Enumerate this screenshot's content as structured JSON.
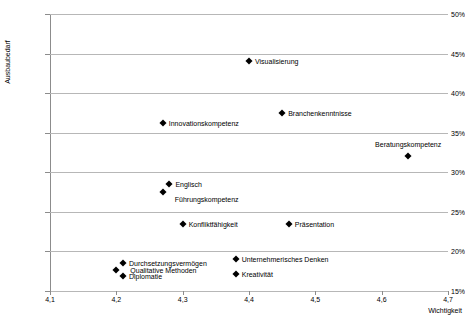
{
  "chart_data": {
    "type": "scatter",
    "title": "",
    "xlabel": "Wichtigkeit",
    "ylabel": "Ausbaubedarf",
    "xlim": [
      4.1,
      4.7
    ],
    "ylim": [
      15,
      50
    ],
    "grid": true,
    "legend": "none",
    "x_tick_labels": [
      "4,1",
      "4,2",
      "4,3",
      "4,4",
      "4,5",
      "4,6",
      "4,7"
    ],
    "x_tick_values": [
      4.1,
      4.2,
      4.3,
      4.4,
      4.5,
      4.6,
      4.7
    ],
    "y_tick_labels": [
      "50%",
      "45%",
      "40%",
      "35%",
      "30%",
      "25%",
      "20%",
      "15%"
    ],
    "y_tick_values": [
      50,
      45,
      40,
      35,
      30,
      25,
      20,
      15
    ],
    "marker": "diamond",
    "marker_color": "#000000",
    "points": [
      {
        "label": "Visualisierung",
        "x": 4.4,
        "y": 44.0,
        "label_pos": "right"
      },
      {
        "label": "Branchenkenntnisse",
        "x": 4.45,
        "y": 37.5,
        "label_pos": "right"
      },
      {
        "label": "Innovationskompetenz",
        "x": 4.27,
        "y": 36.2,
        "label_pos": "right"
      },
      {
        "label": "Beratungskompetenz",
        "x": 4.64,
        "y": 32.0,
        "label_pos": "above"
      },
      {
        "label": "Englisch",
        "x": 4.28,
        "y": 28.5,
        "label_pos": "right"
      },
      {
        "label": "Führungskompetenz",
        "x": 4.27,
        "y": 27.5,
        "label_pos": "right-low"
      },
      {
        "label": "Konfliktfähigkeit",
        "x": 4.3,
        "y": 23.5,
        "label_pos": "right"
      },
      {
        "label": "Präsentation",
        "x": 4.46,
        "y": 23.5,
        "label_pos": "right"
      },
      {
        "label": "Durchsetzungsvermögen",
        "x": 4.21,
        "y": 18.5,
        "label_pos": "right"
      },
      {
        "label": "Qualitative Methoden",
        "x": 4.2,
        "y": 17.7,
        "label_pos": "right-far"
      },
      {
        "label": "Diplomatie",
        "x": 4.21,
        "y": 16.9,
        "label_pos": "right"
      },
      {
        "label": "Unternehmerisches Denken",
        "x": 4.38,
        "y": 19.0,
        "label_pos": "right"
      },
      {
        "label": "Kreativität",
        "x": 4.38,
        "y": 17.2,
        "label_pos": "right"
      }
    ]
  }
}
